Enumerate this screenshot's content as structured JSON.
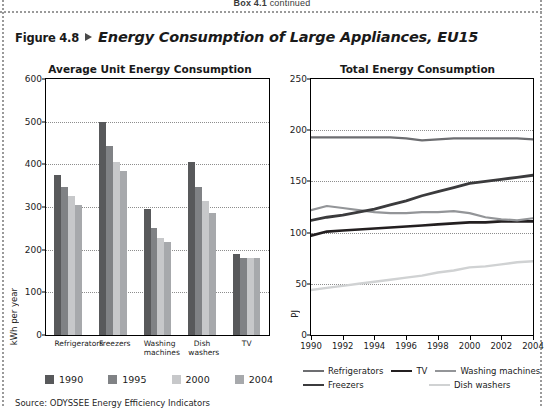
{
  "page_header": {
    "box_label": "Box 4.1",
    "continued": "continued"
  },
  "figure": {
    "number": "Figure 4.8",
    "title": "Energy Consumption of Large Appliances, EU15",
    "arrow_icon": "triangle-right-icon",
    "source": "Source: ODYSSEE Energy Efficiency Indicators"
  },
  "colors": {
    "series_1990": "#58595b",
    "series_1995": "#808285",
    "series_2000": "#c7c8ca",
    "series_2004": "#a7a9ac",
    "refrigerators_line": "#6d6e71",
    "tv_line": "#231f20",
    "washing_line": "#939598",
    "freezers_line": "#3b3b3d",
    "dish_line": "#d0d2d3",
    "gridline": "#8d8d8d",
    "axis": "#000000"
  },
  "bar_legend": [
    {
      "label": "1990",
      "color": "#58595b"
    },
    {
      "label": "1995",
      "color": "#808285"
    },
    {
      "label": "2000",
      "color": "#c7c8ca"
    },
    {
      "label": "2004",
      "color": "#a7a9ac"
    }
  ],
  "line_legend": [
    {
      "label": "Refrigerators",
      "color": "#6d6e71",
      "width": 2.2
    },
    {
      "label": "TV",
      "color": "#231f20",
      "width": 2.6
    },
    {
      "label": "Washing machines",
      "color": "#939598",
      "width": 2.2
    },
    {
      "label": "Freezers",
      "color": "#3b3b3d",
      "width": 2.8
    },
    {
      "label": "Dish washers",
      "color": "#d0d2d3",
      "width": 2.4
    }
  ],
  "chart_data": [
    {
      "id": "bar",
      "type": "bar",
      "title": "Average Unit Energy Consumption",
      "xlabel": "",
      "ylabel": "kWh per year",
      "ylim": [
        0,
        600
      ],
      "yticks": [
        0,
        100,
        200,
        300,
        400,
        500,
        600
      ],
      "grid": true,
      "legend_position": "bottom",
      "categories": [
        "Refrigerators",
        "Freezers",
        "Washing machines",
        "Dish washers",
        "TV"
      ],
      "series": [
        {
          "name": "1990",
          "color": "#58595b",
          "values": [
            375,
            500,
            295,
            405,
            190
          ]
        },
        {
          "name": "1995",
          "color": "#808285",
          "values": [
            347,
            443,
            250,
            348,
            180
          ]
        },
        {
          "name": "2000",
          "color": "#c7c8ca",
          "values": [
            325,
            405,
            228,
            315,
            180
          ]
        },
        {
          "name": "2004",
          "color": "#a7a9ac",
          "values": [
            305,
            385,
            217,
            287,
            180
          ]
        }
      ]
    },
    {
      "id": "line",
      "type": "line",
      "title": "Total Energy Consumption",
      "xlabel": "",
      "ylabel": "PJ",
      "ylim": [
        0,
        250
      ],
      "yticks": [
        0,
        50,
        100,
        150,
        200,
        250
      ],
      "xlim": [
        1990,
        2004
      ],
      "xticks": [
        1990,
        1992,
        1994,
        1996,
        1998,
        2000,
        2002,
        2004
      ],
      "grid": true,
      "legend_position": "bottom",
      "x": [
        1990,
        1991,
        1992,
        1993,
        1994,
        1995,
        1996,
        1997,
        1998,
        1999,
        2000,
        2001,
        2002,
        2003,
        2004
      ],
      "series": [
        {
          "name": "Refrigerators",
          "color": "#6d6e71",
          "values": [
            193,
            193,
            193,
            193,
            193,
            193,
            192,
            190,
            191,
            192,
            192,
            192,
            192,
            192,
            191
          ]
        },
        {
          "name": "TV",
          "color": "#231f20",
          "values": [
            97,
            101,
            102,
            103,
            104,
            105,
            106,
            107,
            108,
            109,
            110,
            110,
            111,
            111,
            111
          ]
        },
        {
          "name": "Washing machines",
          "color": "#939598",
          "values": [
            122,
            126,
            124,
            122,
            120,
            119,
            119,
            120,
            120,
            121,
            119,
            115,
            113,
            112,
            114
          ]
        },
        {
          "name": "Freezers",
          "color": "#3b3b3d",
          "values": [
            112,
            115,
            117,
            120,
            123,
            127,
            131,
            136,
            140,
            144,
            148,
            150,
            152,
            154,
            156
          ]
        },
        {
          "name": "Dish washers",
          "color": "#d0d2d3",
          "values": [
            44,
            46,
            48,
            50,
            52,
            54,
            56,
            58,
            61,
            63,
            66,
            67,
            69,
            71,
            72
          ]
        }
      ]
    }
  ]
}
